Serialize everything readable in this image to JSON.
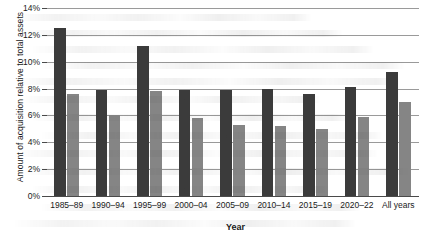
{
  "chart_data": {
    "type": "bar",
    "title": "",
    "subtitle": "",
    "xlabel": "Year",
    "ylabel": "Amount of acquisition relative to total assets",
    "categories": [
      "1985–89",
      "1990–94",
      "1995–99",
      "2000–04",
      "2005–09",
      "2010–14",
      "2015–19",
      "2020–22",
      "All years"
    ],
    "series": [
      {
        "name": "series-1",
        "color": "#3b3b3b",
        "values": [
          12.5,
          7.9,
          11.2,
          7.9,
          7.9,
          8.0,
          7.6,
          8.1,
          9.2
        ]
      },
      {
        "name": "series-2",
        "color": "#858585",
        "values": [
          7.6,
          6.0,
          7.8,
          5.8,
          5.3,
          5.2,
          5.0,
          5.9,
          7.0
        ]
      }
    ],
    "ylim": [
      0,
      14
    ],
    "ytick_values": [
      0,
      2,
      4,
      6,
      8,
      10,
      12,
      14
    ],
    "ytick_labels": [
      "0%",
      "2%",
      "4%",
      "6%",
      "8%",
      "10%",
      "12%",
      "14%"
    ],
    "grid": true,
    "grid_axis": "y",
    "legend": false,
    "legend_position": "none"
  },
  "colors": {
    "series_dark": "#3b3b3b",
    "series_light": "#858585",
    "gridline": "#9a9a9a",
    "axis": "#4a4a4a",
    "background": "#ffffff",
    "text": "#1a1a1a"
  }
}
